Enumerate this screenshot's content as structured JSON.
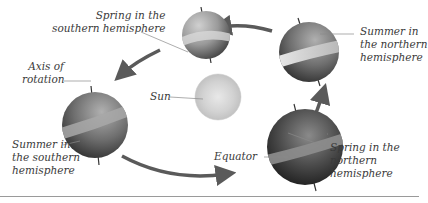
{
  "diagram": {
    "type": "seasons-orbit",
    "colors": {
      "background": "#ffffff",
      "arrow": "#5a5a5a",
      "leader_line": "#8a8a8a",
      "label_text": "#3a3a3a",
      "rule": "#9a9a9a"
    },
    "labels": {
      "spring_south": {
        "line1": "Spring in the",
        "line2": "southern hemisphere"
      },
      "summer_north": {
        "line1": "Summer in",
        "line2": "the northern",
        "line3": "hemisphere"
      },
      "axis": {
        "line1": "Axis of",
        "line2": "rotation"
      },
      "sun": {
        "text": "Sun"
      },
      "summer_south": {
        "line1": "Summer in",
        "line2": "the southern",
        "line3": "hemisphere"
      },
      "equator": {
        "text": "Equator"
      },
      "spring_north": {
        "line1": "Spring in the",
        "line2": "northern",
        "line3": "hemisphere"
      }
    },
    "bodies": [
      {
        "id": "sun",
        "name": "Sun",
        "cx": 218,
        "cy": 97,
        "r": 23
      },
      {
        "id": "globe-top",
        "name": "Earth — spring in the southern hemisphere",
        "cx": 206,
        "cy": 35,
        "r": 24
      },
      {
        "id": "globe-right",
        "name": "Earth — summer in the northern hemisphere",
        "cx": 309,
        "cy": 52,
        "r": 30
      },
      {
        "id": "globe-left",
        "name": "Earth — summer in the southern hemisphere",
        "cx": 95,
        "cy": 125,
        "r": 33
      },
      {
        "id": "globe-bottom",
        "name": "Earth — spring in the northern hemisphere",
        "cx": 305,
        "cy": 147,
        "r": 38
      }
    ],
    "orbit_direction": "counter-clockwise (right → top → left → bottom)"
  }
}
